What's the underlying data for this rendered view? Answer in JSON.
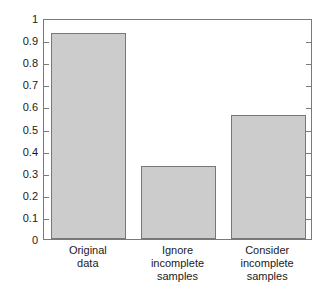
{
  "chart_data": {
    "type": "bar",
    "title": "",
    "xlabel": "",
    "ylabel": "",
    "categories": [
      "Original data",
      "Ignore incomplete samples",
      "Consider incomplete samples"
    ],
    "category_lines": [
      [
        "Original",
        "data"
      ],
      [
        "Ignore",
        "incomplete",
        "samples"
      ],
      [
        "Consider",
        "incomplete",
        "samples"
      ]
    ],
    "values": [
      0.93,
      0.33,
      0.56
    ],
    "ylim": [
      0,
      1
    ],
    "ytick_labels": [
      "0",
      "0.1",
      "0.2",
      "0.3",
      "0.4",
      "0.5",
      "0.6",
      "0.7",
      "0.8",
      "0.9",
      "1"
    ],
    "ytick_values": [
      0,
      0.1,
      0.2,
      0.3,
      0.4,
      0.5,
      0.6,
      0.7,
      0.8,
      0.9,
      1
    ],
    "grid": false,
    "legend": "none",
    "bar_fill_color": "#cccccc",
    "bar_edge_color": "#777777",
    "axis_color": "#7a7a7a",
    "background_color": "#ffffff"
  }
}
